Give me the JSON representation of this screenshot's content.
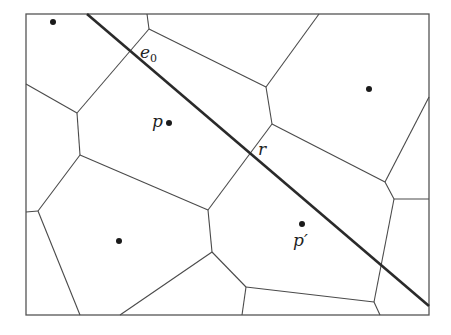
{
  "diagram": {
    "type": "voronoi-diagram",
    "frame": {
      "x1": 26,
      "y1": 14,
      "x2": 429,
      "y2": 315
    },
    "colors": {
      "edges": "#4a4a4a",
      "line": "#2a2a2a",
      "sites": "#1a1a1a"
    },
    "labels": {
      "e0_main": "e",
      "e0_sub": "0",
      "p": "p",
      "r": "r",
      "p_prime": "p′"
    },
    "sites": [
      {
        "name": "site-top-left",
        "x": 53,
        "y": 22
      },
      {
        "name": "site-p",
        "x": 169,
        "y": 123
      },
      {
        "name": "site-right",
        "x": 369,
        "y": 89
      },
      {
        "name": "site-bottom-left",
        "x": 119,
        "y": 241
      },
      {
        "name": "site-p-prime",
        "x": 302,
        "y": 224
      }
    ],
    "line": {
      "name": "query-line",
      "x1": 87,
      "y1": 14,
      "x2": 429,
      "y2": 306
    },
    "edges": [
      [
        147,
        14,
        149,
        29
      ],
      [
        149,
        29,
        266,
        87
      ],
      [
        149,
        29,
        77,
        113
      ],
      [
        26,
        84,
        77,
        113
      ],
      [
        77,
        113,
        80,
        155
      ],
      [
        80,
        155,
        208,
        210
      ],
      [
        80,
        155,
        38,
        211
      ],
      [
        26,
        212,
        38,
        211
      ],
      [
        38,
        211,
        80,
        315
      ],
      [
        208,
        210,
        212,
        252
      ],
      [
        208,
        210,
        272,
        124
      ],
      [
        266,
        87,
        272,
        124
      ],
      [
        266,
        87,
        319,
        14
      ],
      [
        272,
        124,
        385,
        182
      ],
      [
        429,
        97,
        385,
        182
      ],
      [
        385,
        182,
        394,
        199
      ],
      [
        394,
        199,
        429,
        199
      ],
      [
        394,
        199,
        374,
        302
      ],
      [
        374,
        302,
        380,
        315
      ],
      [
        374,
        302,
        246,
        287
      ],
      [
        246,
        287,
        242,
        315
      ],
      [
        246,
        287,
        212,
        252
      ],
      [
        212,
        252,
        120,
        315
      ]
    ]
  }
}
